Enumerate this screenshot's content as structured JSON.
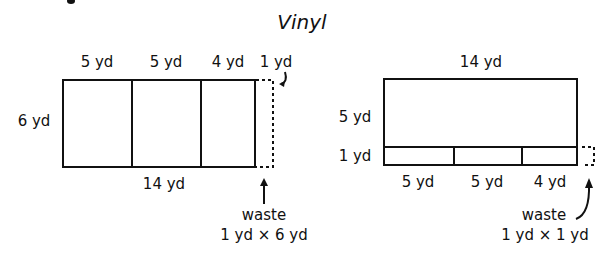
{
  "title": "Vinyl",
  "left_diagram": {
    "top_labels": [
      "5 yd",
      "5 yd",
      "4 yd",
      "1 yd"
    ],
    "side_label": "6 yd",
    "bottom_label": "14 yd",
    "waste_label": "waste",
    "waste_dims": "1 yd × 6 yd"
  },
  "right_diagram": {
    "top_label": "14 yd",
    "side_labels": [
      "5 yd",
      "1 yd"
    ],
    "bottom_labels": [
      "5 yd",
      "5 yd",
      "4 yd"
    ],
    "waste_label": "waste",
    "waste_dims": "1 yd × 1 yd"
  },
  "colors": {
    "line": "#111111",
    "background": "#ffffff"
  }
}
